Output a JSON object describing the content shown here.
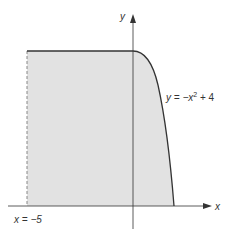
{
  "diagram": {
    "axis_x_label": "x",
    "axis_y_label": "y",
    "curve_label_prefix": "y = −x",
    "curve_label_exp": "2",
    "curve_label_suffix": " + 4",
    "boundary_label": "x = −5",
    "colors": {
      "fill": "#e2e2e2",
      "stroke": "#333333",
      "dashed": "#888888"
    }
  }
}
